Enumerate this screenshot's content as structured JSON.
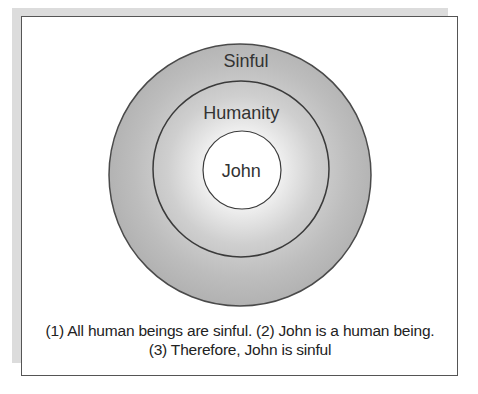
{
  "diagram": {
    "type": "nested-circles (Euler diagram)",
    "circles": [
      {
        "label": "Sinful",
        "cx": 240,
        "cy": 175,
        "r": 131
      },
      {
        "label": "Humanity",
        "cx": 241,
        "cy": 169,
        "r": 88
      },
      {
        "label": "John",
        "cx": 242,
        "cy": 170,
        "r": 39
      }
    ]
  },
  "labels": {
    "outer": "Sinful",
    "middle": "Humanity",
    "inner": "John"
  },
  "caption": {
    "line1": "(1) All human beings are sinful.  (2) John is a human being.",
    "line2": "(3) Therefore, John is sinful"
  },
  "colors": {
    "outer_fill": "#b4b4b4",
    "gradient_center": "#ffffff",
    "stroke": "#4a4a4a",
    "text": "#333333"
  }
}
